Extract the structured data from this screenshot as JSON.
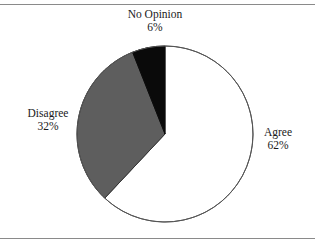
{
  "figure": {
    "background_color": "#ffffff",
    "rule_color": "#8a8a8a",
    "has_top_rule": true,
    "has_bottom_rule": true
  },
  "chart_data": {
    "type": "pie",
    "title": "",
    "subtitle": "",
    "xlabel": "",
    "ylabel": "",
    "legend_position": "none",
    "labels_position": "outside",
    "start_angle_deg": 0,
    "direction": "clockwise",
    "units": "percent",
    "categories": [
      "Agree",
      "Disagree",
      "No Opinion"
    ],
    "values": [
      62,
      32,
      6
    ],
    "slices": [
      {
        "label": "Agree",
        "value": 62,
        "value_text": "62%",
        "color": "#ffffff",
        "edge_color": "#555555",
        "start_angle_deg": 0,
        "end_angle_deg": 223.2
      },
      {
        "label": "Disagree",
        "value": 32,
        "value_text": "32%",
        "color": "#5e5e5e",
        "edge_color": "#333333",
        "start_angle_deg": 223.2,
        "end_angle_deg": 338.4
      },
      {
        "label": "No Opinion",
        "value": 6,
        "value_text": "6%",
        "color": "#0a0a0a",
        "edge_color": "#0a0a0a",
        "start_angle_deg": 338.4,
        "end_angle_deg": 360
      }
    ]
  }
}
